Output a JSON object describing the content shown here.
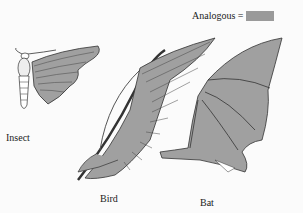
{
  "legend": {
    "label": "Analogous =",
    "swatch_color": "#9a9a9a"
  },
  "labels": {
    "insect": "Insect",
    "bird": "Bird",
    "bat": "Bat"
  },
  "colors": {
    "wing_fill": "#a0a0a0",
    "outline": "#333333",
    "background": "#fbfbfb"
  }
}
